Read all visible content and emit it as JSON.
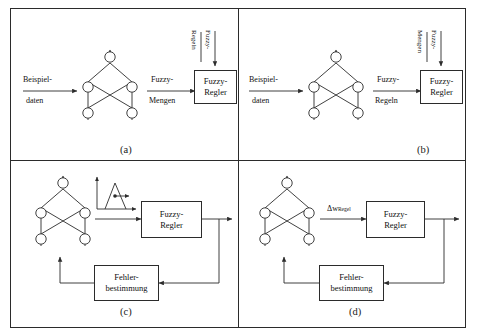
{
  "figure": {
    "title": "",
    "panels": [
      {
        "id": "a",
        "label": "(a)",
        "input_arrow_top": "Beispiel-",
        "input_arrow_bottom": "daten",
        "mid_arrow_top": "Fuzzy-",
        "mid_arrow_bottom": "Mengen",
        "vertical_label_left": "Regeln",
        "vertical_label_right": "Fuzzy-",
        "controller_line1": "Fuzzy-",
        "controller_line2": "Regler",
        "network": "neural-network-5-node",
        "has_feedback": false,
        "has_membership_plot": false,
        "delta_label": ""
      },
      {
        "id": "b",
        "label": "(b)",
        "input_arrow_top": "Beispiel-",
        "input_arrow_bottom": "daten",
        "mid_arrow_top": "Fuzzy-",
        "mid_arrow_bottom": "Regeln",
        "vertical_label_left": "Mengen",
        "vertical_label_right": "Fuzzy-",
        "controller_line1": "Fuzzy-",
        "controller_line2": "Regler",
        "network": "neural-network-5-node",
        "has_feedback": false,
        "has_membership_plot": false,
        "delta_label": ""
      },
      {
        "id": "c",
        "label": "(c)",
        "input_arrow_top": "",
        "input_arrow_bottom": "",
        "mid_arrow_top": "",
        "mid_arrow_bottom": "",
        "vertical_label_left": "",
        "vertical_label_right": "",
        "controller_line1": "Fuzzy-",
        "controller_line2": "Regler",
        "error_line1": "Fehler-",
        "error_line2": "bestimmung",
        "network": "neural-network-5-node",
        "has_feedback": true,
        "has_membership_plot": true,
        "delta_label": ""
      },
      {
        "id": "d",
        "label": "(d)",
        "input_arrow_top": "",
        "input_arrow_bottom": "",
        "mid_arrow_top": "",
        "mid_arrow_bottom": "",
        "vertical_label_left": "",
        "vertical_label_right": "",
        "controller_line1": "Fuzzy-",
        "controller_line2": "Regler",
        "error_line1": "Fehler-",
        "error_line2": "bestimmung",
        "network": "neural-network-5-node",
        "has_feedback": true,
        "has_membership_plot": false,
        "delta_symbol": "Δw",
        "delta_subscript": "Regel"
      }
    ],
    "colors": {
      "stroke": "#2b2b2b",
      "background": "#ffffff",
      "text": "#111111"
    }
  }
}
